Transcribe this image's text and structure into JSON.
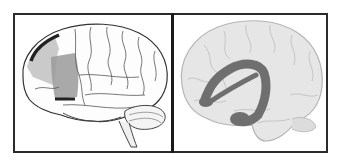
{
  "figure": {
    "panels": [
      {
        "id": "left",
        "description": "Lateral view of brain sketch with shaded frontal lobe region",
        "highlight_color": "#5a5a5a"
      },
      {
        "id": "right",
        "description": "Light gray brain outline with dark gray arcuate/hippocampal-like curved structure",
        "highlight_color": "#6f6f6f"
      }
    ],
    "colors": {
      "border": "#2b2b2b",
      "brain_fill_right": "#e4e4e4",
      "brain_line_right": "#b9b9b9",
      "brain_line_left": "#3a3a3a"
    }
  }
}
